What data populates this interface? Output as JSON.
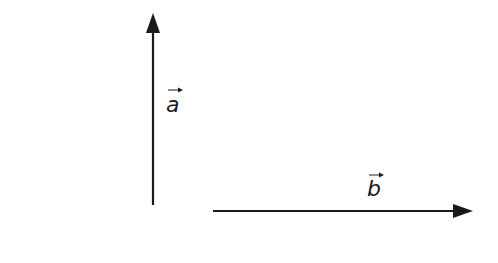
{
  "diagram": {
    "vectors": [
      {
        "name": "a",
        "label": "a",
        "direction": "up",
        "color": "#1a1a1a"
      },
      {
        "name": "b",
        "label": "b",
        "direction": "right",
        "color": "#1a1a1a"
      }
    ]
  }
}
